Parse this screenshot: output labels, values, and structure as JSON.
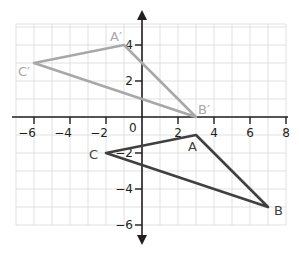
{
  "plane": {
    "unit_px": 18,
    "origin_px": [
      142,
      117
    ],
    "x_range": [
      -7,
      8
    ],
    "y_range": [
      -6,
      5
    ],
    "x_ticks": [
      {
        "value": -6,
        "label": "−6"
      },
      {
        "value": -4,
        "label": "−4"
      },
      {
        "value": -2,
        "label": "−2"
      },
      {
        "value": 2,
        "label": "2"
      },
      {
        "value": 4,
        "label": "4"
      },
      {
        "value": 6,
        "label": "6"
      },
      {
        "value": 8,
        "label": "8"
      }
    ],
    "y_ticks": [
      {
        "value": 4,
        "label": "4"
      },
      {
        "value": 2,
        "label": "2"
      },
      {
        "value": -2,
        "label": "−2"
      },
      {
        "value": -4,
        "label": "−4"
      },
      {
        "value": -6,
        "label": "−6"
      }
    ],
    "origin_label": "0"
  },
  "colors": {
    "original": "#404040",
    "image": "#a8a8a8",
    "axis": "#231f20",
    "grid": "#d9d9d9"
  },
  "triangles": [
    {
      "name": "original",
      "vertices": [
        {
          "label": "A",
          "x": 3,
          "y": -1,
          "dx": -8,
          "dy": 16
        },
        {
          "label": "B",
          "x": 7,
          "y": -5,
          "dx": 6,
          "dy": 8
        },
        {
          "label": "C",
          "x": -2,
          "y": -2,
          "dx": -17,
          "dy": 6
        }
      ]
    },
    {
      "name": "image",
      "vertices": [
        {
          "label": "A′",
          "x": -1,
          "y": 4,
          "dx": -14,
          "dy": -4
        },
        {
          "label": "B′",
          "x": 3,
          "y": 0,
          "dx": 2,
          "dy": -3
        },
        {
          "label": "C′",
          "x": -6,
          "y": 3,
          "dx": -16,
          "dy": 13
        }
      ]
    }
  ]
}
